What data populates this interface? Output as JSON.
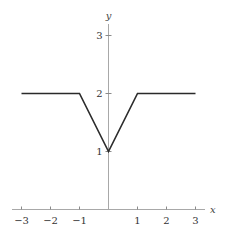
{
  "chart_data": {
    "type": "line",
    "title": "",
    "xlabel": "x",
    "ylabel": "y",
    "xlim": [
      -3,
      3
    ],
    "ylim": [
      0,
      3
    ],
    "xticks": [
      -3,
      -2,
      -1,
      1,
      2,
      3
    ],
    "xtick_labels": [
      "−3",
      "−2",
      "−1",
      "1",
      "2",
      "3"
    ],
    "yticks": [
      1,
      2,
      3
    ],
    "ytick_labels": [
      "1",
      "2",
      "3"
    ],
    "grid": false,
    "legend": "none",
    "series": [
      {
        "name": "f(x)",
        "color": "#2a2a2a",
        "x": [
          -3,
          -1,
          0,
          1,
          3
        ],
        "y": [
          2,
          2,
          1,
          2,
          2
        ]
      }
    ]
  }
}
